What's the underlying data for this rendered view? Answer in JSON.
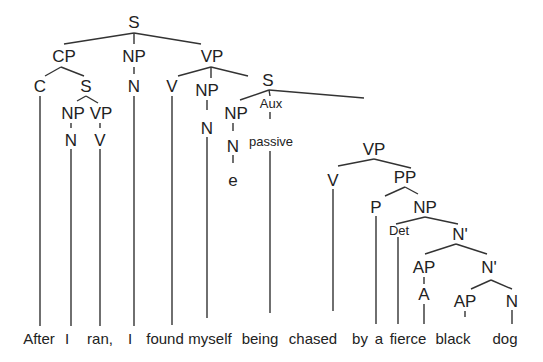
{
  "diagram": {
    "type": "syntax-tree",
    "nodes": [
      {
        "id": "S0",
        "label": "S",
        "x": 134,
        "y": 28
      },
      {
        "id": "CP",
        "label": "CP",
        "x": 64,
        "y": 62
      },
      {
        "id": "NP1",
        "label": "NP",
        "x": 134,
        "y": 62
      },
      {
        "id": "VP1",
        "label": "VP",
        "x": 212,
        "y": 62
      },
      {
        "id": "C",
        "label": "C",
        "x": 40,
        "y": 92
      },
      {
        "id": "S1",
        "label": "S",
        "x": 86,
        "y": 92
      },
      {
        "id": "N1",
        "label": "N",
        "x": 134,
        "y": 92
      },
      {
        "id": "V1",
        "label": "V",
        "x": 172,
        "y": 92
      },
      {
        "id": "NP2",
        "label": "NP",
        "x": 207,
        "y": 95
      },
      {
        "id": "S2",
        "label": "S",
        "x": 267,
        "y": 85
      },
      {
        "id": "NP3",
        "label": "NP",
        "x": 73,
        "y": 118
      },
      {
        "id": "VP2",
        "label": "VP",
        "x": 101,
        "y": 118
      },
      {
        "id": "N2",
        "label": "N",
        "x": 71,
        "y": 145
      },
      {
        "id": "V2",
        "label": "V",
        "x": 100,
        "y": 145
      },
      {
        "id": "N3",
        "label": "N",
        "x": 207,
        "y": 133
      },
      {
        "id": "NP4",
        "label": "NP",
        "x": 236,
        "y": 118
      },
      {
        "id": "Aux",
        "label": "Aux",
        "x": 270,
        "y": 107,
        "small": true
      },
      {
        "id": "N4",
        "label": "N",
        "x": 234,
        "y": 150
      },
      {
        "id": "passive",
        "label": "passive",
        "x": 271,
        "y": 147,
        "small": true
      },
      {
        "id": "e",
        "label": "e",
        "x": 233,
        "y": 184
      },
      {
        "id": "VP3",
        "label": "VP",
        "x": 373,
        "y": 154
      },
      {
        "id": "V3",
        "label": "V",
        "x": 333,
        "y": 185
      },
      {
        "id": "PP",
        "label": "PP",
        "x": 405,
        "y": 182
      },
      {
        "id": "P",
        "label": "P",
        "x": 376,
        "y": 212
      },
      {
        "id": "NP5",
        "label": "NP",
        "x": 425,
        "y": 212
      },
      {
        "id": "Det",
        "label": "Det",
        "x": 399,
        "y": 233,
        "small": true
      },
      {
        "id": "Nb1",
        "label": "N'",
        "x": 460,
        "y": 236
      },
      {
        "id": "AP1",
        "label": "AP",
        "x": 423,
        "y": 272
      },
      {
        "id": "Nb2",
        "label": "N'",
        "x": 488,
        "y": 272
      },
      {
        "id": "A1",
        "label": "A",
        "x": 423,
        "y": 300
      },
      {
        "id": "AP2",
        "label": "AP",
        "x": 465,
        "y": 306
      },
      {
        "id": "N5",
        "label": "N",
        "x": 512,
        "y": 306
      },
      {
        "id": "A2",
        "label": "A",
        "x": 465,
        "y": 333
      }
    ],
    "words": [
      {
        "text": "After",
        "x": 39
      },
      {
        "text": "I",
        "x": 67
      },
      {
        "text": "ran,",
        "x": 100
      },
      {
        "text": "I",
        "x": 130
      },
      {
        "text": "found",
        "x": 165
      },
      {
        "text": "myself",
        "x": 210
      },
      {
        "text": "being",
        "x": 260
      },
      {
        "text": "chased",
        "x": 313
      },
      {
        "text": "by",
        "x": 360
      },
      {
        "text": "a",
        "x": 379
      },
      {
        "text": "fierce",
        "x": 408
      },
      {
        "text": "black",
        "x": 453
      },
      {
        "text": "dog",
        "x": 505
      }
    ]
  }
}
